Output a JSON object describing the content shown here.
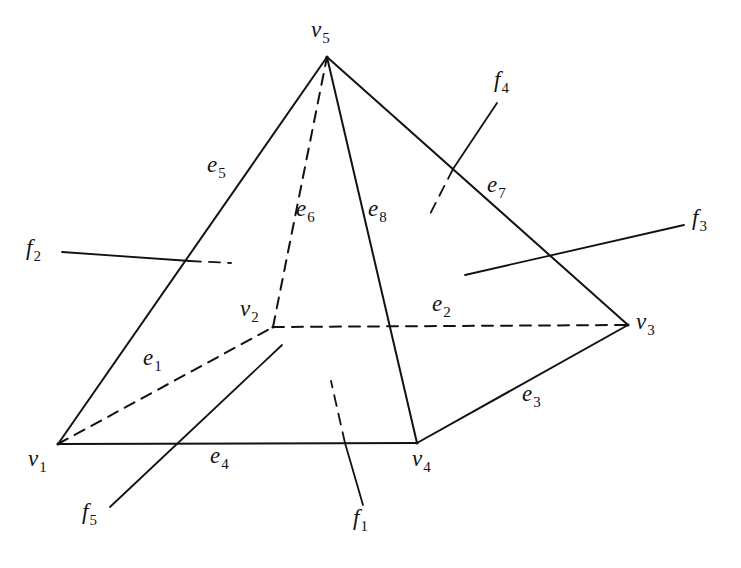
{
  "figure": {
    "kind": "labelled-polyhedron-diagram",
    "background_color": "#ffffff",
    "stroke_color": "#121212",
    "hidden_edge_style": "dashed",
    "visible_edge_style": "solid"
  },
  "vertices": [
    {
      "id": "v1",
      "label": "v",
      "sub": "1",
      "x": 58,
      "y": 444,
      "label_x": 28,
      "label_y": 447
    },
    {
      "id": "v2",
      "label": "v",
      "sub": "2",
      "x": 273,
      "y": 327,
      "label_x": 240,
      "label_y": 297
    },
    {
      "id": "v3",
      "label": "v",
      "sub": "3",
      "x": 628,
      "y": 325,
      "label_x": 636,
      "label_y": 310
    },
    {
      "id": "v4",
      "label": "v",
      "sub": "4",
      "x": 417,
      "y": 443,
      "label_x": 412,
      "label_y": 447
    },
    {
      "id": "v5",
      "label": "v",
      "sub": "5",
      "x": 327,
      "y": 57,
      "label_x": 311,
      "label_y": 18
    }
  ],
  "edges": [
    {
      "id": "e1",
      "label": "e",
      "sub": "1",
      "from": "v1",
      "to": "v2",
      "hidden": true,
      "label_x": 143,
      "label_y": 346
    },
    {
      "id": "e2",
      "label": "e",
      "sub": "2",
      "from": "v2",
      "to": "v3",
      "hidden": true,
      "label_x": 432,
      "label_y": 292
    },
    {
      "id": "e3",
      "label": "e",
      "sub": "3",
      "from": "v4",
      "to": "v3",
      "hidden": false,
      "label_x": 522,
      "label_y": 382
    },
    {
      "id": "e4",
      "label": "e",
      "sub": "4",
      "from": "v1",
      "to": "v4",
      "hidden": false,
      "label_x": 210,
      "label_y": 444
    },
    {
      "id": "e5",
      "label": "e",
      "sub": "5",
      "from": "v1",
      "to": "v5",
      "hidden": false,
      "label_x": 207,
      "label_y": 153
    },
    {
      "id": "e6",
      "label": "e",
      "sub": "6",
      "from": "v2",
      "to": "v5",
      "hidden": true,
      "label_x": 296,
      "label_y": 197
    },
    {
      "id": "e7",
      "label": "e",
      "sub": "7",
      "from": "v5",
      "to": "v3",
      "hidden": false,
      "label_x": 487,
      "label_y": 173
    },
    {
      "id": "e8",
      "label": "e",
      "sub": "8",
      "from": "v5",
      "to": "v4",
      "hidden": false,
      "label_x": 368,
      "label_y": 197
    }
  ],
  "faces": [
    {
      "id": "f1",
      "label": "f",
      "sub": "1",
      "label_x": 353,
      "label_y": 506,
      "leader_solid": [
        363,
        505,
        345,
        443
      ],
      "leader_dashed": [
        345,
        443,
        331,
        381
      ]
    },
    {
      "id": "f2",
      "label": "f",
      "sub": "2",
      "label_x": 26,
      "label_y": 236,
      "leader_solid": [
        62,
        252,
        190,
        261
      ],
      "leader_dashed": [
        190,
        261,
        231,
        263
      ]
    },
    {
      "id": "f3",
      "label": "f",
      "sub": "3",
      "label_x": 692,
      "label_y": 206,
      "leader_solid": [
        684,
        225,
        465,
        275
      ],
      "leader_dashed": null
    },
    {
      "id": "f4",
      "label": "f",
      "sub": "4",
      "label_x": 494,
      "label_y": 68,
      "leader_solid": [
        497,
        103,
        453,
        169
      ],
      "leader_dashed": [
        453,
        169,
        428,
        218
      ]
    },
    {
      "id": "f5",
      "label": "f",
      "sub": "5",
      "label_x": 82,
      "label_y": 500,
      "leader_solid": [
        110,
        507,
        282,
        345
      ],
      "leader_dashed": null
    }
  ]
}
